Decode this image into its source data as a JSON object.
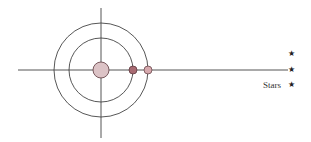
{
  "diagram": {
    "center": {
      "x": 101,
      "y": 70
    },
    "axes": {
      "horizontal": {
        "x1": 18,
        "x2": 288,
        "y": 70
      },
      "vertical": {
        "x": 101,
        "y1": 8,
        "y2": 138
      },
      "color": "#555555"
    },
    "orbits": [
      {
        "name": "inner-orbit",
        "radius": 32
      },
      {
        "name": "outer-orbit",
        "radius": 47
      }
    ],
    "central_body": {
      "radius": 8,
      "fill": "#dcc3c6",
      "stroke": "#6b4a4e"
    },
    "planets": [
      {
        "name": "inner-planet",
        "x": 133,
        "radius": 4,
        "fill": "#a86a72"
      },
      {
        "name": "outer-planet",
        "x": 148,
        "radius": 4,
        "fill": "#d7a9ae"
      }
    ],
    "stars": [
      {
        "x": 292,
        "y": 55,
        "glyph": "★"
      },
      {
        "x": 292,
        "y": 71,
        "glyph": "★"
      },
      {
        "x": 292,
        "y": 86,
        "glyph": "★"
      }
    ],
    "stars_label": "Stars"
  }
}
